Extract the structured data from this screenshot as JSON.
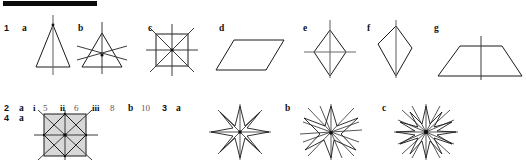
{
  "page": {
    "width": 526,
    "height": 160,
    "background": "#ffffff",
    "ink": "#1a1a1a",
    "rule_color": "#0b0b0b",
    "shade_color": "#d8d8d8"
  },
  "top_rule": {
    "name": "section-rule",
    "visible": true
  },
  "question_1": {
    "number": "1",
    "items": [
      {
        "letter": "a",
        "shape": "isosceles-triangle",
        "lines_of_symmetry": 1
      },
      {
        "letter": "b",
        "shape": "equilateral-triangle",
        "lines_of_symmetry": 3
      },
      {
        "letter": "c",
        "shape": "square",
        "lines_of_symmetry": 4
      },
      {
        "letter": "d",
        "shape": "parallelogram",
        "lines_of_symmetry": 0
      },
      {
        "letter": "e",
        "shape": "rhombus",
        "lines_of_symmetry": 2
      },
      {
        "letter": "f",
        "shape": "kite",
        "lines_of_symmetry": 1
      },
      {
        "letter": "g",
        "shape": "isosceles-trapezium",
        "lines_of_symmetry": 1
      }
    ]
  },
  "question_2": {
    "number": "2",
    "part_a": {
      "letter": "a",
      "subparts": [
        {
          "roman": "i",
          "answer": "5"
        },
        {
          "roman": "ii",
          "answer": "6"
        },
        {
          "roman": "iii",
          "answer": "8"
        }
      ]
    },
    "part_b": {
      "letter": "b",
      "answer": "10"
    }
  },
  "question_3": {
    "number": "3",
    "items": [
      {
        "letter": "a",
        "shape": "eight-point-star"
      },
      {
        "letter": "b",
        "shape": "seven-point-star"
      },
      {
        "letter": "c",
        "shape": "twelve-point-star"
      }
    ]
  },
  "question_4": {
    "number": "4",
    "items": [
      {
        "letter": "a",
        "shape": "shaded-square-with-inscribed-square",
        "lines_of_symmetry": 4
      }
    ]
  }
}
